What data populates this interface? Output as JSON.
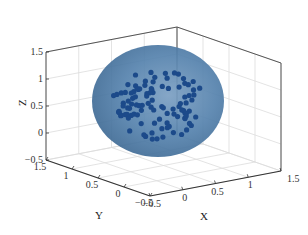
{
  "chart_data": {
    "type": "scatter3d",
    "title": "",
    "xlabel": "X",
    "ylabel": "Y",
    "zlabel": "Z",
    "xlim": [
      -0.5,
      1.5
    ],
    "ylim": [
      -0.5,
      1.5
    ],
    "zlim": [
      -0.5,
      1.5
    ],
    "x_ticks": [
      "-0.5",
      "0",
      "0.5",
      "1",
      "1.5"
    ],
    "y_ticks": [
      "-0.5",
      "0",
      "0.5",
      "1",
      "1.5"
    ],
    "z_ticks": [
      "-0.5",
      "0",
      "0.5",
      "1",
      "1.5"
    ],
    "grid": true,
    "surface": {
      "shape": "ellipsoid",
      "center": [
        0.5,
        0.5,
        0.5
      ],
      "color": "#3d6a99",
      "alpha": 0.75
    },
    "marker_color": "#1f4e8c",
    "points_note": "~100 points scattered within the ellipsoid"
  },
  "colors": {
    "ellipsoid": "#4a77a3",
    "ellipsoid_edge": "#2f5c88",
    "point": "#1c4a8a",
    "axis": "#555555",
    "grid": "#dcdcdc"
  }
}
